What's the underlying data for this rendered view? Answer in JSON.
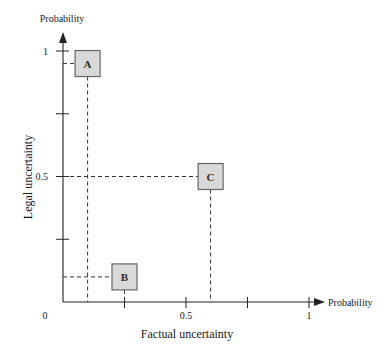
{
  "chart_data": {
    "type": "scatter",
    "title": "",
    "xlabel": "Factual uncertainty",
    "ylabel": "Legal uncertainty",
    "x_axis_end_label": "Probability",
    "y_axis_end_label": "Probability",
    "xlim": [
      0,
      1
    ],
    "ylim": [
      0,
      1
    ],
    "grid": false,
    "legend": null,
    "x_ticks": [
      0.25,
      0.5,
      0.75,
      1
    ],
    "y_ticks": [
      0.25,
      0.5,
      0.75,
      1
    ],
    "x_tick_labels": [
      {
        "value": 0,
        "text": "0"
      },
      {
        "value": 0.5,
        "text": "0.5"
      },
      {
        "value": 1,
        "text": "1"
      }
    ],
    "y_tick_labels": [
      {
        "value": 0.5,
        "text": "0.5"
      },
      {
        "value": 1,
        "text": "1"
      }
    ],
    "points": [
      {
        "label": "A",
        "x": 0.1,
        "y": 0.95
      },
      {
        "label": "B",
        "x": 0.25,
        "y": 0.1
      },
      {
        "label": "C",
        "x": 0.6,
        "y": 0.5
      }
    ],
    "colors": {
      "box_fill": "#d9d9d9",
      "box_stroke": "#666666",
      "axis": "#222222"
    }
  }
}
